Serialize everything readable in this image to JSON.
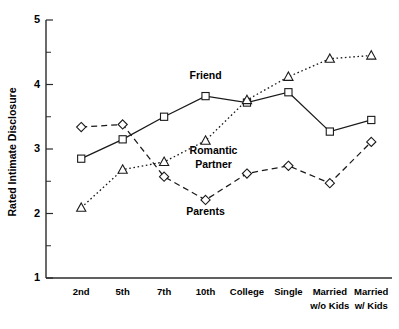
{
  "chart_data": {
    "type": "line",
    "title": "",
    "xlabel": "",
    "ylabel": "Rated Intimate Disclosure",
    "ylim": [
      1,
      5
    ],
    "yticks": [
      1,
      2,
      3,
      4,
      5
    ],
    "ytick_labels": [
      "1",
      "2",
      "3",
      "4",
      "5"
    ],
    "y_minor_ticks": [
      1.5,
      2.5,
      3.5,
      4.5
    ],
    "grid": false,
    "legend": "inline-annotations",
    "categories": [
      "2nd",
      "5th",
      "7th",
      "10th",
      "College",
      "Single",
      "Married w/o Kids",
      "Married w/ Kids"
    ],
    "category_labels": [
      {
        "line1": "2nd",
        "line2": ""
      },
      {
        "line1": "5th",
        "line2": ""
      },
      {
        "line1": "7th",
        "line2": ""
      },
      {
        "line1": "10th",
        "line2": ""
      },
      {
        "line1": "College",
        "line2": ""
      },
      {
        "line1": "Single",
        "line2": ""
      },
      {
        "line1": "Married",
        "line2": "w/o Kids"
      },
      {
        "line1": "Married",
        "line2": "w/ Kids"
      }
    ],
    "series": [
      {
        "name": "Friend",
        "marker": "square",
        "linestyle": "solid",
        "color": "#1a1a1a",
        "values": [
          2.85,
          3.15,
          3.5,
          3.82,
          3.72,
          3.88,
          3.27,
          3.45
        ],
        "annotation": {
          "text": "Friend",
          "x_category": "10th",
          "value": 4.08
        }
      },
      {
        "name": "Romantic Partner",
        "marker": "triangle",
        "linestyle": "dotted",
        "color": "#1a1a1a",
        "values": [
          2.09,
          2.68,
          2.8,
          3.13,
          3.76,
          4.12,
          4.4,
          4.45
        ],
        "annotation": {
          "text": "Romantic\nPartner",
          "line1": "Romantic",
          "line2": "Partner",
          "x_category": "10th",
          "value": 2.93
        }
      },
      {
        "name": "Parents",
        "marker": "diamond",
        "linestyle": "dashed",
        "color": "#1a1a1a",
        "values": [
          3.34,
          3.38,
          2.57,
          2.21,
          2.62,
          2.74,
          2.47,
          3.11
        ],
        "annotation": {
          "text": "Parents",
          "x_category": "10th",
          "value": 1.97
        }
      }
    ]
  },
  "annotations": {
    "friend": "Friend",
    "romantic_line1": "Romantic",
    "romantic_line2": "Partner",
    "parents": "Parents"
  }
}
